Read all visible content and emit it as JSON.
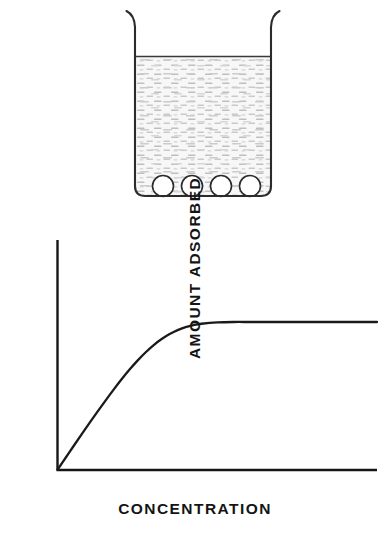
{
  "figure": {
    "name": "adsorption-isotherm-figure",
    "background_color": "#ffffff",
    "ink_color": "#1a1a1a"
  },
  "beaker": {
    "name": "beaker-diagram",
    "description": "Beaker containing solution with four adsorbent particles resting on the bottom",
    "liquid_surface_label": "",
    "liquid_fill_color": "#f2f2f2",
    "liquid_stipple_color": "#b8b8b8",
    "wall_color": "#2b2b2b",
    "particle_count": 4,
    "particle_fill_color": "#ffffff",
    "particles": [
      {
        "label": "",
        "cx": 163,
        "cy": 186,
        "r": 10.5
      },
      {
        "label": "",
        "cx": 192,
        "cy": 186,
        "r": 10.5
      },
      {
        "label": "",
        "cx": 221,
        "cy": 186,
        "r": 10.5
      },
      {
        "label": "",
        "cx": 250,
        "cy": 186,
        "r": 10.5
      }
    ]
  },
  "chart_data": {
    "type": "line",
    "title": "",
    "subtitle": "",
    "xlabel": "CONCENTRATION",
    "ylabel": "AMOUNT ADSORBED",
    "grid": false,
    "legend": [],
    "legend_position": "none",
    "xlim": [
      0,
      10
    ],
    "ylim": [
      0,
      1.15
    ],
    "xticks": [],
    "yticks": [],
    "xticklabels": [],
    "yticklabels": [],
    "annotations": [],
    "series": [
      {
        "name": "Langmuir adsorption isotherm",
        "color": "#1a1a1a",
        "x": [
          0.0,
          0.25,
          0.5,
          0.75,
          1.0,
          1.25,
          1.5,
          1.75,
          2.0,
          2.25,
          2.5,
          2.75,
          3.0,
          3.25,
          3.5,
          3.75,
          4.0,
          4.25,
          4.5,
          5.0,
          5.5,
          6.0,
          6.5,
          7.0,
          7.5,
          8.0,
          8.5,
          9.0,
          9.5,
          10.0
        ],
        "y": [
          0.0,
          0.08,
          0.16,
          0.239,
          0.317,
          0.394,
          0.469,
          0.542,
          0.612,
          0.678,
          0.739,
          0.794,
          0.843,
          0.884,
          0.918,
          0.945,
          0.965,
          0.979,
          0.988,
          0.997,
          1.0,
          1.0,
          1.0,
          1.0,
          1.0,
          1.0,
          1.0,
          1.0,
          1.0,
          1.0
        ]
      }
    ],
    "plateau_value": 1.0,
    "plateau_begins_at_x": 5.5
  }
}
